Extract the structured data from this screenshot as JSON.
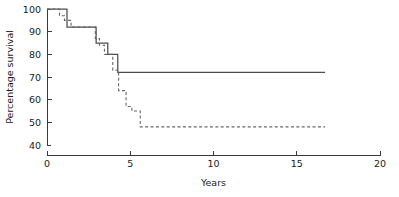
{
  "chart_data": {
    "type": "line",
    "title": "",
    "subtitle": "",
    "xlabel": "Years",
    "ylabel": "Percentage survival",
    "xlim": [
      0,
      20
    ],
    "ylim": [
      40,
      100
    ],
    "xticks": [
      0,
      5,
      10,
      15,
      20
    ],
    "yticks": [
      40,
      50,
      60,
      70,
      80,
      90,
      100
    ],
    "xtick_labels": [
      "0",
      "5",
      "10",
      "15",
      "20"
    ],
    "ytick_labels": [
      "40",
      "50",
      "60",
      "70",
      "80",
      "90",
      "100"
    ],
    "grid": false,
    "legend": "none",
    "legend_position": "none",
    "annotations": [],
    "series": [
      {
        "name": "solid-curve",
        "style": "solid",
        "step": "post",
        "color": "#4d4d4d",
        "x": [
          0.0,
          1.2,
          1.2,
          2.95,
          2.95,
          3.65,
          3.65,
          4.25,
          4.25,
          16.7
        ],
        "y": [
          100,
          100,
          92,
          92,
          85,
          85,
          80,
          80,
          72,
          72
        ],
        "steps": [
          {
            "x": 0.0,
            "y": 100
          },
          {
            "x": 1.2,
            "y": 92
          },
          {
            "x": 2.95,
            "y": 85
          },
          {
            "x": 3.65,
            "y": 80
          },
          {
            "x": 4.25,
            "y": 72
          },
          {
            "x": 16.7,
            "y": 72
          }
        ]
      },
      {
        "name": "dashed-curve",
        "style": "dashed",
        "step": "post",
        "color": "#666666",
        "x": [
          0.0,
          0.75,
          0.75,
          1.05,
          1.05,
          1.45,
          1.45,
          2.9,
          2.9,
          3.15,
          3.15,
          3.45,
          3.45,
          3.95,
          3.95,
          4.3,
          4.3,
          4.75,
          4.75,
          5.1,
          5.1,
          5.6,
          5.6,
          16.7
        ],
        "y": [
          100,
          100,
          97,
          97,
          95,
          95,
          92,
          92,
          87,
          87,
          84,
          84,
          80,
          80,
          73,
          73,
          64,
          64,
          57,
          57,
          55,
          55,
          48,
          48
        ],
        "steps": [
          {
            "x": 0.0,
            "y": 100
          },
          {
            "x": 0.75,
            "y": 97
          },
          {
            "x": 1.05,
            "y": 95
          },
          {
            "x": 1.45,
            "y": 92
          },
          {
            "x": 2.9,
            "y": 87
          },
          {
            "x": 3.15,
            "y": 84
          },
          {
            "x": 3.45,
            "y": 80
          },
          {
            "x": 3.95,
            "y": 73
          },
          {
            "x": 4.3,
            "y": 64
          },
          {
            "x": 4.75,
            "y": 57
          },
          {
            "x": 5.1,
            "y": 55
          },
          {
            "x": 5.6,
            "y": 48
          },
          {
            "x": 16.7,
            "y": 48
          }
        ]
      }
    ]
  },
  "axes": {
    "x_label": "Years",
    "y_label": "Percentage survival",
    "x_tick_0": "0",
    "x_tick_1": "5",
    "x_tick_2": "10",
    "x_tick_3": "15",
    "x_tick_4": "20",
    "y_tick_0": "40",
    "y_tick_1": "50",
    "y_tick_2": "60",
    "y_tick_3": "70",
    "y_tick_4": "80",
    "y_tick_5": "90",
    "y_tick_6": "100"
  },
  "colors": {
    "axis": "#3a3a3a",
    "solid_series": "#4d4d4d",
    "dashed_series": "#666666",
    "background": "#ffffff",
    "text": "#1a1a1a"
  }
}
